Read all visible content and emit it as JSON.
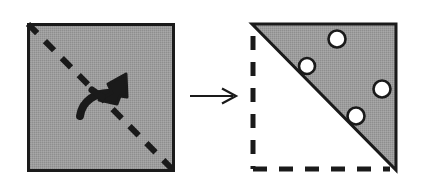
{
  "figure": {
    "type": "paper-folding-puzzle",
    "background_color": "#ffffff",
    "ink_color": "#1a1a1a",
    "paper_fill_color": "#9a9a9a",
    "hole_fill_color": "#ffffff",
    "canvas": {
      "width": 424,
      "height": 189
    }
  },
  "left_panel": {
    "label": "Unfolded square with fold line",
    "square": {
      "x": 28,
      "y": 24,
      "width": 145,
      "height": 146,
      "fill": "#9a9a9a",
      "stroke": "#1a1a1a",
      "stroke_width": 3
    },
    "fold_line": {
      "label": "dashed diagonal fold line",
      "from": {
        "x": 28,
        "y": 24
      },
      "to": {
        "x": 173,
        "y": 170
      },
      "style": "dashed",
      "dash_pattern": "13 11",
      "stroke_width": 6,
      "stroke": "#1a1a1a"
    },
    "fold_arrow": {
      "label": "curved fold arrow pointing up-right across the diagonal",
      "direction": "up-right",
      "stroke_width": 7,
      "stroke": "#1a1a1a"
    }
  },
  "transition_arrow": {
    "label": "transformation arrow",
    "glyph": "right-arrow",
    "from": {
      "x": 190,
      "y": 96
    },
    "to": {
      "x": 236,
      "y": 96
    },
    "stroke_width": 2.2,
    "stroke": "#1a1a1a"
  },
  "right_panel": {
    "label": "Folded triangle with four punched holes",
    "bounds": {
      "x": 252,
      "y": 24,
      "width": 144,
      "height": 146
    },
    "triangle": {
      "label": "folded paper (upper-right half)",
      "points": "252,24 396,24 396,170",
      "fill": "#9a9a9a",
      "stroke": "#1a1a1a",
      "stroke_width": 3
    },
    "ghost_outline": {
      "label": "dashed outline of folded-away lower-left half",
      "style": "dashed",
      "dash_pattern": "14 12",
      "stroke_width": 5,
      "stroke": "#1a1a1a",
      "segments": [
        {
          "name": "left-edge",
          "from": {
            "x": 253,
            "y": 36
          },
          "to": {
            "x": 253,
            "y": 169
          }
        },
        {
          "name": "bottom-edge",
          "from": {
            "x": 253,
            "y": 169
          },
          "to": {
            "x": 390,
            "y": 169
          }
        }
      ]
    },
    "holes": [
      {
        "id": "hole-1",
        "cx": 337,
        "cy": 39,
        "r": 8.5,
        "label": "punched hole top"
      },
      {
        "id": "hole-2",
        "cx": 307,
        "cy": 66,
        "r": 8.0,
        "label": "punched hole upper-left"
      },
      {
        "id": "hole-3",
        "cx": 382,
        "cy": 89,
        "r": 8.5,
        "label": "punched hole right"
      },
      {
        "id": "hole-4",
        "cx": 356,
        "cy": 116,
        "r": 8.5,
        "label": "punched hole lower"
      }
    ],
    "hole_count": 4
  }
}
